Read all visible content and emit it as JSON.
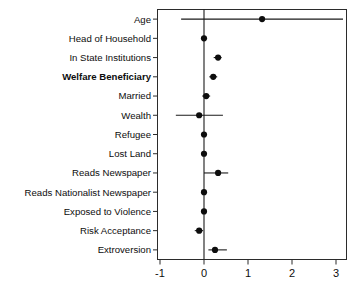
{
  "chart_data": {
    "type": "scatter",
    "subtype": "coefficient-forest-plot",
    "title": "",
    "subtitle": "",
    "xlabel": "",
    "ylabel": "",
    "xlim": [
      -1.25,
      3.3
    ],
    "ylim": [
      0,
      13
    ],
    "grid": false,
    "legend": null,
    "reference_line": 0,
    "x_ticks": [
      -1,
      0,
      1,
      2,
      3
    ],
    "x_tick_labels": [
      "-1",
      "0",
      "1",
      "2",
      "3"
    ],
    "categories": [
      "Age",
      "Head of Household",
      "In State Institutions",
      "Welfare Beneficiary",
      "Married",
      "Wealth",
      "Refugee",
      "Lost Land",
      "Reads Newspaper",
      "Reads Nationalist Newspaper",
      "Exposed to Violence",
      "Risk Acceptance",
      "Extroversion"
    ],
    "emphasized_categories": [
      "Welfare Beneficiary"
    ],
    "values": [
      1.32,
      0.0,
      0.32,
      0.21,
      0.05,
      -0.11,
      0.0,
      0.0,
      0.32,
      0.0,
      0.0,
      -0.11,
      0.25
    ],
    "ci_low": [
      -0.52,
      -0.05,
      0.22,
      0.12,
      -0.04,
      -0.64,
      -0.04,
      -0.04,
      0.0,
      -0.04,
      -0.04,
      -0.21,
      0.1
    ],
    "ci_high": [
      3.16,
      0.06,
      0.4,
      0.3,
      0.14,
      0.43,
      0.05,
      0.05,
      0.55,
      0.05,
      0.05,
      -0.02,
      0.52
    ],
    "series": [
      {
        "name": "Coefficient estimate",
        "values": [
          1.32,
          0.0,
          0.32,
          0.21,
          0.05,
          -0.11,
          0.0,
          0.0,
          0.32,
          0.0,
          0.0,
          -0.11,
          0.25
        ]
      }
    ],
    "points": [
      {
        "label": "Age",
        "estimate": 1.32,
        "ci_low": -0.52,
        "ci_high": 3.16,
        "bold": false
      },
      {
        "label": "Head of Household",
        "estimate": 0.0,
        "ci_low": -0.05,
        "ci_high": 0.06,
        "bold": false
      },
      {
        "label": "In State Institutions",
        "estimate": 0.32,
        "ci_low": 0.22,
        "ci_high": 0.4,
        "bold": false
      },
      {
        "label": "Welfare Beneficiary",
        "estimate": 0.21,
        "ci_low": 0.12,
        "ci_high": 0.3,
        "bold": true
      },
      {
        "label": "Married",
        "estimate": 0.05,
        "ci_low": -0.04,
        "ci_high": 0.14,
        "bold": false
      },
      {
        "label": "Wealth",
        "estimate": -0.11,
        "ci_low": -0.64,
        "ci_high": 0.43,
        "bold": false
      },
      {
        "label": "Refugee",
        "estimate": 0.0,
        "ci_low": -0.04,
        "ci_high": 0.05,
        "bold": false
      },
      {
        "label": "Lost Land",
        "estimate": 0.0,
        "ci_low": -0.04,
        "ci_high": 0.05,
        "bold": false
      },
      {
        "label": "Reads Newspaper",
        "estimate": 0.32,
        "ci_low": 0.0,
        "ci_high": 0.55,
        "bold": false
      },
      {
        "label": "Reads Nationalist Newspaper",
        "estimate": 0.0,
        "ci_low": -0.04,
        "ci_high": 0.05,
        "bold": false
      },
      {
        "label": "Exposed to Violence",
        "estimate": 0.0,
        "ci_low": -0.04,
        "ci_high": 0.05,
        "bold": false
      },
      {
        "label": "Risk Acceptance",
        "estimate": -0.11,
        "ci_low": -0.21,
        "ci_high": -0.02,
        "bold": false
      },
      {
        "label": "Extroversion",
        "estimate": 0.25,
        "ci_low": 0.1,
        "ci_high": 0.52,
        "bold": false
      }
    ],
    "colors": {
      "point": "#0d0d0d",
      "line": "#1a1a1a",
      "frame": "#2b2b2b",
      "background": "#ffffff",
      "text": "#0d0d0d"
    }
  }
}
